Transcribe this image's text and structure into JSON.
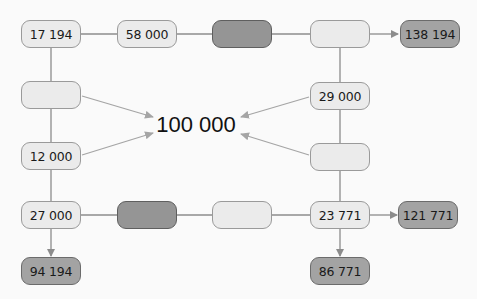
{
  "diagram": {
    "center_value": "100 000",
    "nodes": {
      "r1c1": "17 194",
      "r1c2": "58 000",
      "r1c3": "",
      "r1c4": "",
      "r1_result": "138 194",
      "r2c1": "",
      "r2c4": "29 000",
      "r3c1": "12 000",
      "r3c4": "",
      "r4c1": "27 000",
      "r4c2": "",
      "r4c3": "",
      "r4c4": "23 771",
      "r4_result": "121 771",
      "r5c1": "94 194",
      "r5c4": "86 771"
    },
    "colors": {
      "light_fill": "#ebebeb",
      "dark_fill": "#959595",
      "result_fill": "#a3a3a3",
      "line": "#8c8c8c",
      "arrow": "#a0a0a0",
      "background": "#fafafa"
    }
  }
}
